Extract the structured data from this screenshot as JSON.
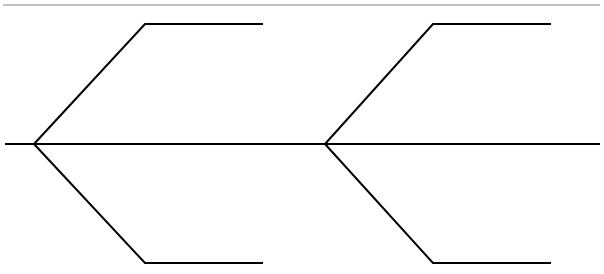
{
  "diagram": {
    "type": "chevron-branch-diagram",
    "colors": {
      "background": "#ffffff",
      "stroke": "#000000",
      "top_rule": "#808080"
    },
    "nodes": [
      {
        "id": "vertex-1",
        "branches": [
          "upper",
          "lower"
        ]
      },
      {
        "id": "vertex-2",
        "branches": [
          "upper",
          "lower"
        ]
      }
    ],
    "labels": []
  }
}
